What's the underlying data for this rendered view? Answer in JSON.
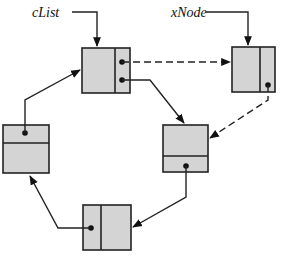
{
  "diagram": {
    "type": "circular linked list",
    "labels": {
      "clist": "cList",
      "xnode": "xNode"
    },
    "nodes": [
      {
        "id": "A",
        "name": "first-node",
        "pointed_by": "cList"
      },
      {
        "id": "X",
        "name": "inserted-node",
        "pointed_by": "xNode"
      },
      {
        "id": "B",
        "name": "right-node"
      },
      {
        "id": "C",
        "name": "bottom-node"
      },
      {
        "id": "D",
        "name": "left-node"
      }
    ],
    "edges": [
      {
        "from": "cList",
        "to": "A",
        "style": "solid"
      },
      {
        "from": "xNode",
        "to": "X",
        "style": "solid"
      },
      {
        "from": "A",
        "to": "X",
        "style": "dashed"
      },
      {
        "from": "X",
        "to": "B",
        "style": "dashed"
      },
      {
        "from": "A",
        "to": "B",
        "style": "solid"
      },
      {
        "from": "B",
        "to": "C",
        "style": "solid"
      },
      {
        "from": "C",
        "to": "D",
        "style": "solid"
      },
      {
        "from": "D",
        "to": "A",
        "style": "solid"
      }
    ],
    "colors": {
      "node_fill": "#d4d4d4",
      "stroke": "#222222"
    }
  }
}
